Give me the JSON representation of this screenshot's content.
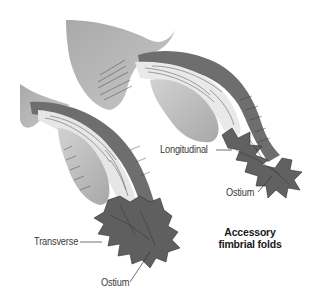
{
  "figure": {
    "title": "Accessory fimbrial folds",
    "caption_lines": [
      "Accessory",
      "fimbrial folds"
    ],
    "colors": {
      "background": "#ffffff",
      "mesosalpinx": "#b4b4b4",
      "tube_wall": "#6e6e6e",
      "mucosa_folds": "#e6e6e6",
      "ampulla": "#bdbdbd",
      "fimbriae": "#5f5f5f",
      "text": "#3a3a3a"
    }
  },
  "specimens": [
    {
      "name": "upper-tube",
      "labels": {
        "fold_type": "Longitudinal",
        "opening": "Ostium"
      }
    },
    {
      "name": "lower-tube",
      "labels": {
        "fold_type": "Transverse",
        "opening": "Ostium"
      }
    }
  ]
}
